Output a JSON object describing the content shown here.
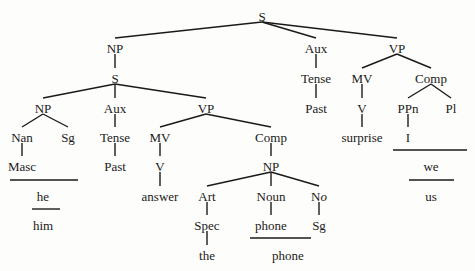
{
  "diagram": {
    "type": "syntactic-tree",
    "nodes": [
      {
        "id": "root_S",
        "label": "S",
        "x": 262,
        "y": 16
      },
      {
        "id": "np_top",
        "label": "NP",
        "x": 115,
        "y": 48
      },
      {
        "id": "s_emb",
        "label": "S",
        "x": 115,
        "y": 78
      },
      {
        "id": "aux_top",
        "label": "Aux",
        "x": 316,
        "y": 48
      },
      {
        "id": "vp_top",
        "label": "VP",
        "x": 397,
        "y": 48
      },
      {
        "id": "np_emb",
        "label": "NP",
        "x": 43,
        "y": 108
      },
      {
        "id": "aux_emb",
        "label": "Aux",
        "x": 115,
        "y": 108
      },
      {
        "id": "vp_emb",
        "label": "VP",
        "x": 206,
        "y": 108
      },
      {
        "id": "nan",
        "label": "Nan",
        "x": 22,
        "y": 137
      },
      {
        "id": "sg1",
        "label": "Sg",
        "x": 68,
        "y": 137
      },
      {
        "id": "tense_emb",
        "label": "Tense",
        "x": 115,
        "y": 137
      },
      {
        "id": "mv_emb",
        "label": "MV",
        "x": 160,
        "y": 137
      },
      {
        "id": "comp_emb",
        "label": "Comp",
        "x": 271,
        "y": 137
      },
      {
        "id": "masc",
        "label": "Masc",
        "x": 22,
        "y": 166
      },
      {
        "id": "past_emb",
        "label": "Past",
        "x": 115,
        "y": 166
      },
      {
        "id": "v_emb",
        "label": "V",
        "x": 160,
        "y": 166
      },
      {
        "id": "np_comp",
        "label": "NP",
        "x": 271,
        "y": 166
      },
      {
        "id": "answer",
        "label": "answer",
        "x": 160,
        "y": 196
      },
      {
        "id": "art",
        "label": "Art",
        "x": 207,
        "y": 196
      },
      {
        "id": "noun",
        "label": "Noun",
        "x": 271,
        "y": 196
      },
      {
        "id": "no",
        "label": "No",
        "x": 319,
        "y": 196,
        "italic_part": "o"
      },
      {
        "id": "spec",
        "label": "Spec",
        "x": 207,
        "y": 225
      },
      {
        "id": "phone_n",
        "label": "phone",
        "x": 271,
        "y": 225
      },
      {
        "id": "sg2",
        "label": "Sg",
        "x": 319,
        "y": 225
      },
      {
        "id": "the",
        "label": "the",
        "x": 207,
        "y": 255
      },
      {
        "id": "phone_out",
        "label": "phone",
        "x": 288,
        "y": 255
      },
      {
        "id": "he",
        "label": "he",
        "x": 43,
        "y": 196
      },
      {
        "id": "him",
        "label": "him",
        "x": 43,
        "y": 225
      },
      {
        "id": "tense_top",
        "label": "Tense",
        "x": 316,
        "y": 78
      },
      {
        "id": "past_top",
        "label": "Past",
        "x": 316,
        "y": 108
      },
      {
        "id": "mv_top",
        "label": "MV",
        "x": 362,
        "y": 78
      },
      {
        "id": "comp_top",
        "label": "Comp",
        "x": 431,
        "y": 78
      },
      {
        "id": "v_top",
        "label": "V",
        "x": 362,
        "y": 108
      },
      {
        "id": "ppn",
        "label": "PPn",
        "x": 408,
        "y": 108
      },
      {
        "id": "pl",
        "label": "Pl",
        "x": 451,
        "y": 108
      },
      {
        "id": "surprise",
        "label": "surprise",
        "x": 362,
        "y": 137
      },
      {
        "id": "i",
        "label": "I",
        "x": 408,
        "y": 137
      },
      {
        "id": "we",
        "label": "we",
        "x": 431,
        "y": 166
      },
      {
        "id": "us",
        "label": "us",
        "x": 431,
        "y": 196
      }
    ],
    "edges": [
      [
        "root_S",
        "np_top"
      ],
      [
        "root_S",
        "aux_top"
      ],
      [
        "root_S",
        "vp_top"
      ],
      [
        "np_top",
        "s_emb"
      ],
      [
        "s_emb",
        "np_emb"
      ],
      [
        "s_emb",
        "aux_emb"
      ],
      [
        "s_emb",
        "vp_emb"
      ],
      [
        "np_emb",
        "nan"
      ],
      [
        "np_emb",
        "sg1"
      ],
      [
        "nan",
        "masc"
      ],
      [
        "aux_emb",
        "tense_emb"
      ],
      [
        "tense_emb",
        "past_emb"
      ],
      [
        "vp_emb",
        "mv_emb"
      ],
      [
        "vp_emb",
        "comp_emb"
      ],
      [
        "mv_emb",
        "v_emb"
      ],
      [
        "v_emb",
        "answer"
      ],
      [
        "comp_emb",
        "np_comp"
      ],
      [
        "np_comp",
        "art"
      ],
      [
        "np_comp",
        "noun"
      ],
      [
        "np_comp",
        "no"
      ],
      [
        "art",
        "spec"
      ],
      [
        "spec",
        "the"
      ],
      [
        "noun",
        "phone_n"
      ],
      [
        "no",
        "sg2"
      ],
      [
        "aux_top",
        "tense_top"
      ],
      [
        "tense_top",
        "past_top"
      ],
      [
        "vp_top",
        "mv_top"
      ],
      [
        "vp_top",
        "comp_top"
      ],
      [
        "mv_top",
        "v_top"
      ],
      [
        "v_top",
        "surprise"
      ],
      [
        "comp_top",
        "ppn"
      ],
      [
        "comp_top",
        "pl"
      ],
      [
        "ppn",
        "i"
      ]
    ],
    "rules": [
      {
        "x1": 10,
        "x2": 78,
        "y": 180,
        "note": "Masc+Sg -> he"
      },
      {
        "x1": 32,
        "x2": 60,
        "y": 209,
        "note": "he -> him"
      },
      {
        "x1": 250,
        "x2": 311,
        "y": 238,
        "note": "phone+Sg -> phone"
      },
      {
        "x1": 393,
        "x2": 467,
        "y": 150,
        "note": "I+Pl -> we"
      },
      {
        "x1": 409,
        "x2": 454,
        "y": 180,
        "note": "we -> us"
      }
    ]
  }
}
